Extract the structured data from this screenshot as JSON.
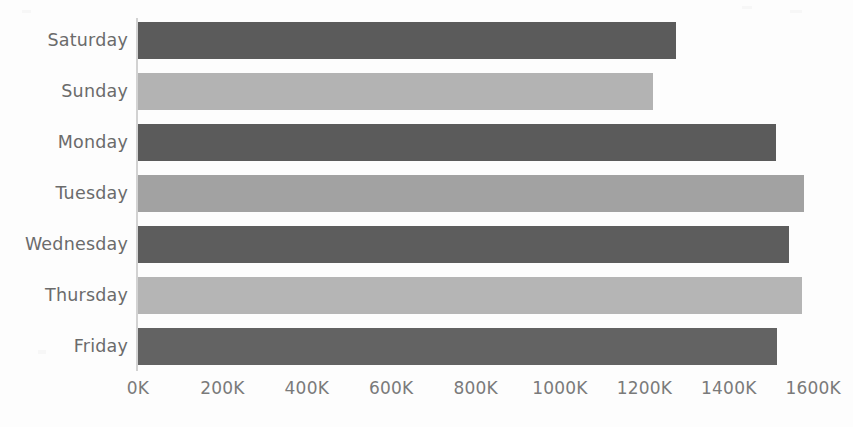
{
  "chart_data": {
    "type": "bar",
    "orientation": "horizontal",
    "title": "",
    "subtitle": "",
    "xlabel": "",
    "ylabel": "",
    "categories": [
      "Saturday",
      "Sunday",
      "Monday",
      "Tuesday",
      "Wednesday",
      "Thursday",
      "Friday"
    ],
    "values": [
      1275000,
      1220000,
      1512000,
      1578000,
      1542000,
      1573000,
      1514000
    ],
    "value_unit": "K",
    "xlim": [
      0,
      1600000
    ],
    "ylim": null,
    "xticks": [
      0,
      200000,
      400000,
      600000,
      800000,
      1000000,
      1200000,
      1400000,
      1600000
    ],
    "xtick_labels": [
      "0K",
      "200K",
      "400K",
      "600K",
      "800K",
      "1000K",
      "1200K",
      "1400K",
      "1600K"
    ],
    "grid": false,
    "legend": null,
    "legend_position": "none",
    "bar_colors": [
      "#5b5b5b",
      "#b3b3b3",
      "#5b5b5b",
      "#a2a2a2",
      "#5d5d5d",
      "#b5b5b5",
      "#636363"
    ],
    "series": [
      {
        "name": "Values",
        "points": [
          {
            "category": "Saturday",
            "value": 1275000,
            "label": "1275K",
            "color": "#5b5b5b"
          },
          {
            "category": "Sunday",
            "value": 1220000,
            "label": "1220K",
            "color": "#b3b3b3"
          },
          {
            "category": "Monday",
            "value": 1512000,
            "label": "1512K",
            "color": "#5b5b5b"
          },
          {
            "category": "Tuesday",
            "value": 1578000,
            "label": "1578K",
            "color": "#a2a2a2"
          },
          {
            "category": "Wednesday",
            "value": 1542000,
            "label": "1542K",
            "color": "#5d5d5d"
          },
          {
            "category": "Thursday",
            "value": 1573000,
            "label": "1573K",
            "color": "#b5b5b5"
          },
          {
            "category": "Friday",
            "value": 1514000,
            "label": "1514K",
            "color": "#636363"
          }
        ]
      }
    ]
  },
  "style": {
    "background": "#fdfdfd",
    "axis_color": "#d2d2d2",
    "tick_text_color": "#7a7a7a",
    "category_text_color": "#6b6b6b"
  },
  "layout": {
    "plot_left_px": 138,
    "plot_top_px": 22,
    "px_per_200k": 84.4,
    "bar_height_px": 37,
    "bar_pitch_px": 51,
    "axis_label_y_px": 378
  }
}
